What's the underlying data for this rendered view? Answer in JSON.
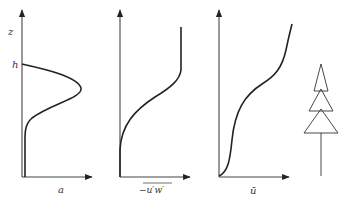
{
  "figure": {
    "vertical_axis_label": "z",
    "height_marker_label": "h",
    "panels": [
      {
        "id": "leaf-area-density",
        "x_label": "a",
        "description": "Leaf area density profile: peaks within canopy, zero above h"
      },
      {
        "id": "reynolds-stress",
        "x_label": "−u′w′",
        "overline": true,
        "description": "Momentum flux increases with height, constant above canopy"
      },
      {
        "id": "mean-velocity",
        "x_label": "ū",
        "description": "Mean wind profile with inflection point near canopy top"
      }
    ],
    "tree_icon": "conifer-tree-icon"
  }
}
